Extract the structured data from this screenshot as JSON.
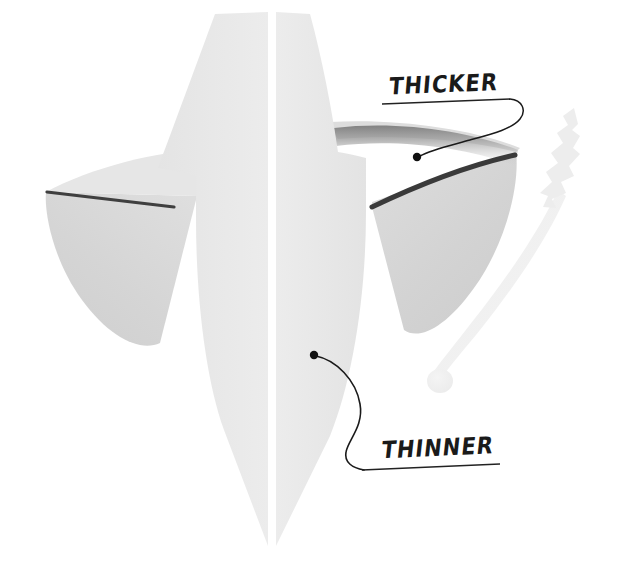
{
  "canvas": {
    "width": 621,
    "height": 578,
    "background_color": "#ffffff",
    "description": "Hand-annotated greyscale rendering of a symmetrical winged blade / arrowhead shape split down the middle, with two handwritten callout labels"
  },
  "palette": {
    "background": "#ffffff",
    "body_light_gray": "#e9e9e9",
    "body_mid_gray": "#e2e2e2",
    "wing_gray": "#d6d6d6",
    "wing_gray_dark": "#cfcfcf",
    "shadow_band": "#8c8c8c",
    "edge_line_dark": "#4a4a4a",
    "ink_black": "#111111",
    "ghost_object": "#f0f0f0",
    "split_line_white": "#ffffff"
  },
  "annotations": [
    {
      "id": "thicker",
      "text": "THICKER",
      "style": "handwritten-uppercase",
      "underlined": true,
      "label_x": 388,
      "label_y": 76,
      "pointer_dot": {
        "x": 417,
        "y": 157,
        "radius": 4
      },
      "points_to": "thick leading edge of right wing",
      "color": "#111111"
    },
    {
      "id": "thinner",
      "text": "THINNER",
      "style": "handwritten-uppercase",
      "underlined": true,
      "label_x": 380,
      "label_y": 440,
      "pointer_dot": {
        "x": 314,
        "y": 355,
        "radius": 4
      },
      "points_to": "thin tapering lower blade of central body",
      "color": "#111111"
    }
  ],
  "shapes": [
    {
      "name": "central-body",
      "role": "main vertical blade, widest at shoulders, tapering to a point at bottom",
      "fill": "#e9e9e9",
      "split": "vertical white centerline at x=272"
    },
    {
      "name": "left-wing",
      "role": "swept triangular fin extending left, curved lower edge",
      "fill": "#d6d6d6",
      "edge_line": "dark straight line along upper edge"
    },
    {
      "name": "right-wing",
      "role": "swept triangular fin extending right, curved lower edge",
      "fill": "#d6d6d6",
      "edge_line": "thick dark line along upper edge (the THICKER feature)",
      "shadow": "soft gradient band under the top rim"
    },
    {
      "name": "ghost-arrow",
      "role": "very faint pale curved shaft with feathered tip at top and round knob at bottom, at right of frame",
      "fill": "#f0f0f0"
    }
  ],
  "geometry": {
    "centerline_x": 272,
    "body_top_y": 12,
    "body_bottom_tip_y": 547,
    "left_wing_tip": {
      "x": 46,
      "y": 192
    },
    "right_wing_tip": {
      "x": 516,
      "y": 152
    },
    "left_wing_bottom": {
      "x": 158,
      "y": 340
    },
    "right_wing_bottom": {
      "x": 412,
      "y": 330
    }
  }
}
